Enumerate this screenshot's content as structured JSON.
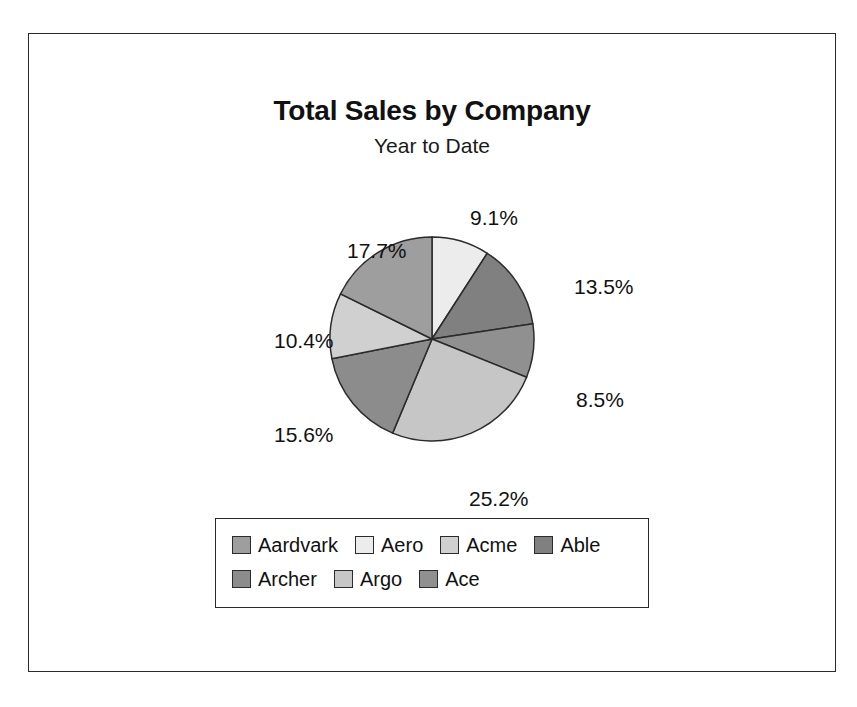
{
  "frame": {
    "border_color": "#2b2b2b"
  },
  "titles": {
    "title": "Total Sales by Company",
    "subtitle": "Year to Date"
  },
  "chart_data": {
    "type": "pie",
    "title": "Total Sales by Company",
    "subtitle": "Year to Date",
    "legend_position": "bottom",
    "start_angle_deg": 0,
    "direction": "clockwise",
    "categories": [
      "Aardvark",
      "Aero",
      "Acme",
      "Able",
      "Archer",
      "Argo",
      "Ace"
    ],
    "values": [
      17.7,
      9.1,
      10.4,
      13.5,
      15.6,
      25.2,
      8.5
    ],
    "value_unit": "%",
    "colors": [
      "#9e9e9e",
      "#ececec",
      "#d0d0d0",
      "#808080",
      "#8c8c8c",
      "#c6c6c6",
      "#909090"
    ],
    "slices": [
      {
        "label": "Aero",
        "value": 9.1,
        "display": "9.1%",
        "color": "#ececec",
        "start_deg": 0.0,
        "end_deg": 32.8
      },
      {
        "label": "Able",
        "value": 13.5,
        "display": "13.5%",
        "color": "#808080",
        "start_deg": 32.8,
        "end_deg": 81.4
      },
      {
        "label": "Ace",
        "value": 8.5,
        "display": "8.5%",
        "color": "#909090",
        "start_deg": 81.4,
        "end_deg": 112.0
      },
      {
        "label": "Argo",
        "value": 25.2,
        "display": "25.2%",
        "color": "#c6c6c6",
        "start_deg": 112.0,
        "end_deg": 202.7
      },
      {
        "label": "Archer",
        "value": 15.6,
        "display": "15.6%",
        "color": "#8c8c8c",
        "start_deg": 202.7,
        "end_deg": 258.9
      },
      {
        "label": "Acme",
        "value": 10.4,
        "display": "10.4%",
        "color": "#d0d0d0",
        "start_deg": 258.9,
        "end_deg": 296.3
      },
      {
        "label": "Aardvark",
        "value": 17.7,
        "display": "17.7%",
        "color": "#9e9e9e",
        "start_deg": 296.3,
        "end_deg": 360.0
      }
    ]
  },
  "pie_labels": [
    {
      "text": "9.1%",
      "x": 441,
      "y": 23
    },
    {
      "text": "13.5%",
      "x": 545,
      "y": 92
    },
    {
      "text": "8.5%",
      "x": 547,
      "y": 205
    },
    {
      "text": "25.2%",
      "x": 440,
      "y": 304
    },
    {
      "text": "15.6%",
      "x": 245,
      "y": 240
    },
    {
      "text": "10.4%",
      "x": 245,
      "y": 146
    },
    {
      "text": "17.7%",
      "x": 318,
      "y": 56
    }
  ],
  "legend": {
    "rows": [
      [
        {
          "label": "Aardvark",
          "color": "#9e9e9e"
        },
        {
          "label": "Aero",
          "color": "#ececec"
        },
        {
          "label": "Acme",
          "color": "#d0d0d0"
        },
        {
          "label": "Able",
          "color": "#808080"
        }
      ],
      [
        {
          "label": "Archer",
          "color": "#8c8c8c"
        },
        {
          "label": "Argo",
          "color": "#c6c6c6"
        },
        {
          "label": "Ace",
          "color": "#909090"
        }
      ]
    ]
  }
}
